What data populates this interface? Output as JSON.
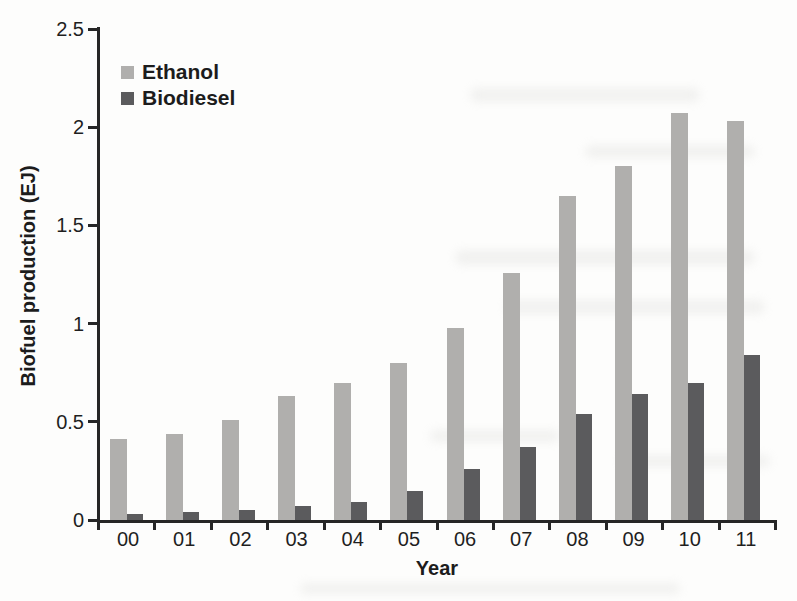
{
  "chart_data": {
    "type": "bar",
    "title": "",
    "xlabel": "Year",
    "ylabel": "Biofuel production (EJ)",
    "categories": [
      "00",
      "01",
      "02",
      "03",
      "04",
      "05",
      "06",
      "07",
      "08",
      "09",
      "10",
      "11"
    ],
    "series": [
      {
        "name": "Ethanol",
        "color": "#b0afad",
        "values": [
          0.41,
          0.44,
          0.51,
          0.63,
          0.7,
          0.8,
          0.98,
          1.26,
          1.65,
          1.8,
          2.07,
          2.03
        ]
      },
      {
        "name": "Biodiesel",
        "color": "#5b5b5d",
        "values": [
          0.03,
          0.04,
          0.05,
          0.07,
          0.09,
          0.15,
          0.26,
          0.37,
          0.54,
          0.64,
          0.7,
          0.84
        ]
      }
    ],
    "ylim": [
      0,
      2.5
    ],
    "yticks": [
      0,
      0.5,
      1,
      1.5,
      2,
      2.5
    ],
    "ytick_labels": [
      "0",
      "0.5",
      "1",
      "1.5",
      "2",
      "2.5"
    ],
    "grid": false,
    "legend_position": "top-left",
    "axis_color": "#262626",
    "text_color": "#1f1f1f",
    "background_color": "#fdfdfc"
  }
}
